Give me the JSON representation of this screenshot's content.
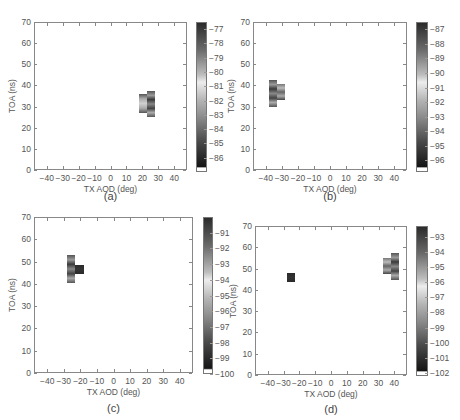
{
  "chart_data": [
    {
      "type": "heatmap",
      "panel": "(a)",
      "xlabel": "TX AOD (deg)",
      "ylabel": "TOA (ns)",
      "xticks": [
        -40,
        -30,
        -20,
        -10,
        0,
        10,
        20,
        30,
        40
      ],
      "yticks": [
        0,
        10,
        20,
        30,
        40,
        50,
        60,
        70
      ],
      "xlim": [
        -48,
        48
      ],
      "ylim": [
        0,
        70
      ],
      "colorbar": {
        "ticks": [
          -77,
          -78,
          -79,
          -80,
          -81,
          -82,
          -83,
          -84,
          -85,
          -86
        ],
        "range": [
          -87,
          -76.5
        ]
      },
      "blocks": [
        {
          "x0": 18,
          "x1": 23,
          "y0": 27,
          "y1": 36,
          "level": "mid-light"
        },
        {
          "x0": 23,
          "x1": 28,
          "y0": 25,
          "y1": 37.5,
          "level": "mid-dark"
        }
      ]
    },
    {
      "type": "heatmap",
      "panel": "(b)",
      "xlabel": "TX AOD (deg)",
      "ylabel": "TOA (ns)",
      "xticks": [
        -40,
        -30,
        -20,
        -10,
        0,
        10,
        20,
        30,
        40
      ],
      "yticks": [
        0,
        10,
        20,
        30,
        40,
        50,
        60,
        70
      ],
      "xlim": [
        -48,
        48
      ],
      "ylim": [
        0,
        70
      ],
      "colorbar": {
        "ticks": [
          -87,
          -88,
          -89,
          -90,
          -91,
          -92,
          -93,
          -94,
          -95,
          -96
        ],
        "range": [
          -96.8,
          -86.5
        ]
      },
      "blocks": [
        {
          "x0": -38,
          "x1": -33,
          "y0": 30,
          "y1": 42.5,
          "level": "mid-dark"
        },
        {
          "x0": -33,
          "x1": -28,
          "y0": 33,
          "y1": 40.5,
          "level": "mid"
        }
      ]
    },
    {
      "type": "heatmap",
      "panel": "(c)",
      "xlabel": "TX AOD (deg)",
      "ylabel": "TOA (ns)",
      "xticks": [
        -40,
        -30,
        -20,
        -10,
        0,
        10,
        20,
        30,
        40
      ],
      "yticks": [
        0,
        10,
        20,
        30,
        40,
        50,
        60,
        70
      ],
      "xlim": [
        -48,
        48
      ],
      "ylim": [
        0,
        70
      ],
      "colorbar": {
        "ticks": [
          -91,
          -92,
          -93,
          -94,
          -95,
          -96,
          -97,
          -98,
          -99,
          -100
        ],
        "range": [
          -100,
          -90
        ]
      },
      "blocks": [
        {
          "x0": -28,
          "x1": -23,
          "y0": 40.5,
          "y1": 53,
          "level": "mid-dark"
        },
        {
          "x0": -23,
          "x1": -18,
          "y0": 44.5,
          "y1": 48.5,
          "level": "dark"
        }
      ]
    },
    {
      "type": "heatmap",
      "panel": "(d)",
      "xlabel": "TX AOD (deg)",
      "ylabel": "TOA (ns)",
      "xticks": [
        -40,
        -30,
        -20,
        -10,
        0,
        10,
        20,
        30,
        40
      ],
      "yticks": [
        0,
        10,
        20,
        30,
        40,
        50,
        60,
        70
      ],
      "xlim": [
        -48,
        48
      ],
      "ylim": [
        0,
        70
      ],
      "colorbar": {
        "ticks": [
          -93,
          -94,
          -95,
          -96,
          -97,
          -98,
          -99,
          -100,
          -101,
          -102
        ],
        "range": [
          -102.2,
          -92.3
        ]
      },
      "blocks": [
        {
          "x0": -28,
          "x1": -23,
          "y0": 43.5,
          "y1": 48,
          "level": "dark"
        },
        {
          "x0": 33,
          "x1": 38,
          "y0": 47.5,
          "y1": 55,
          "level": "mid"
        },
        {
          "x0": 38,
          "x1": 43,
          "y0": 44.5,
          "y1": 57.5,
          "level": "mid-dark"
        }
      ]
    }
  ],
  "captions": [
    "(a)",
    "(b)",
    "(c)",
    "(d)"
  ]
}
